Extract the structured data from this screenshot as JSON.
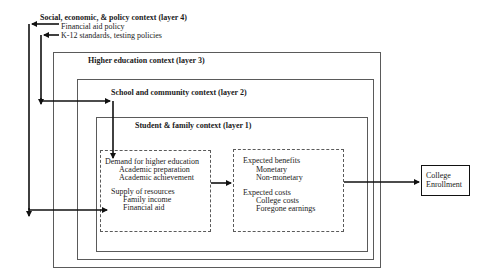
{
  "layer4": {
    "title": "Social, economic, & policy context (layer 4)",
    "items": [
      "Financial aid policy",
      "K-12 standards, testing policies"
    ]
  },
  "layer3": {
    "title": "Higher education context (layer 3)"
  },
  "layer2": {
    "title": "School and community context (layer 2)"
  },
  "layer1": {
    "title": "Student & family context (layer 1)"
  },
  "left_box": {
    "demand_heading": "Demand for higher education",
    "demand_items": [
      "Academic preparation",
      "Academic achievement"
    ],
    "supply_heading": "Supply of resources",
    "supply_items": [
      "Family income",
      "Financial aid"
    ]
  },
  "right_box": {
    "benefits_heading": "Expected benefits",
    "benefits_items": [
      "Monetary",
      "Non-monetary"
    ],
    "costs_heading": "Expected costs",
    "costs_items": [
      "College costs",
      "Foregone earnings"
    ]
  },
  "outcome": {
    "line1": "College",
    "line2": "Enrollment"
  },
  "colors": {
    "line": "#111111",
    "box_border": "#5a5a5a",
    "background": "#ffffff"
  }
}
